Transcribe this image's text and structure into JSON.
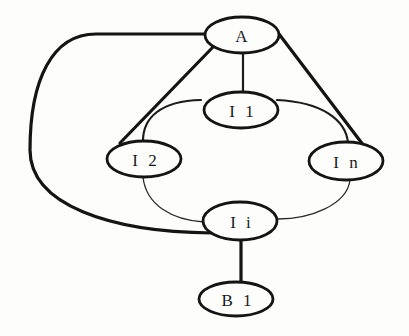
{
  "diagram": {
    "type": "graph",
    "background": "#fdfdfc",
    "stroke_color": "#141414",
    "nodes": [
      {
        "id": "A",
        "label": "A",
        "cx": 242,
        "cy": 35,
        "rx": 37,
        "ry": 18
      },
      {
        "id": "I1",
        "label": "I1",
        "cx": 241,
        "cy": 110,
        "rx": 37,
        "ry": 18
      },
      {
        "id": "I2",
        "label": "I2",
        "cx": 144,
        "cy": 159,
        "rx": 37,
        "ry": 18
      },
      {
        "id": "In",
        "label": "In",
        "cx": 346,
        "cy": 161,
        "rx": 37,
        "ry": 19
      },
      {
        "id": "Ii",
        "label": "Ii",
        "cx": 240,
        "cy": 221,
        "rx": 37,
        "ry": 19
      },
      {
        "id": "B1",
        "label": "B1",
        "cx": 236,
        "cy": 299,
        "rx": 37,
        "ry": 17
      }
    ],
    "edges": [
      {
        "from": "A",
        "to": "Ii",
        "weight": "thick",
        "shape": "outer-left-curve"
      },
      {
        "from": "A",
        "to": "I2",
        "weight": "thick",
        "shape": "straight"
      },
      {
        "from": "A",
        "to": "I1",
        "weight": "medium",
        "shape": "straight"
      },
      {
        "from": "A",
        "to": "In",
        "weight": "thick",
        "shape": "straight"
      },
      {
        "from": "I1",
        "to": "I2",
        "weight": "medium",
        "shape": "arc"
      },
      {
        "from": "I1",
        "to": "In",
        "weight": "medium",
        "shape": "arc"
      },
      {
        "from": "I2",
        "to": "Ii",
        "weight": "thin",
        "shape": "arc"
      },
      {
        "from": "In",
        "to": "Ii",
        "weight": "thin",
        "shape": "arc"
      },
      {
        "from": "Ii",
        "to": "B1",
        "weight": "thick",
        "shape": "straight"
      }
    ]
  },
  "labels": {
    "A": "A",
    "I1": "I 1",
    "I2": "I 2",
    "In": "I n",
    "Ii": "I i",
    "B1": "B 1"
  }
}
